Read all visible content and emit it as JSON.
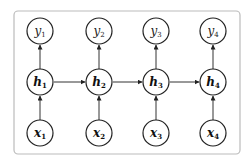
{
  "diagram": {
    "type": "unrolled-rnn",
    "frame": {
      "stroke": "#bbbbbb"
    },
    "columns": [
      {
        "output": {
          "base": "y",
          "sub": "1"
        },
        "hidden": {
          "base": "h",
          "sub": "1"
        },
        "input": {
          "base": "x",
          "sub": "1"
        }
      },
      {
        "output": {
          "base": "y",
          "sub": "2"
        },
        "hidden": {
          "base": "h",
          "sub": "2"
        },
        "input": {
          "base": "x",
          "sub": "2"
        }
      },
      {
        "output": {
          "base": "y",
          "sub": "3"
        },
        "hidden": {
          "base": "h",
          "sub": "3"
        },
        "input": {
          "base": "x",
          "sub": "3"
        }
      },
      {
        "output": {
          "base": "y",
          "sub": "4"
        },
        "hidden": {
          "base": "h",
          "sub": "4"
        },
        "input": {
          "base": "x",
          "sub": "4"
        }
      }
    ],
    "edges": [
      "x1->h1",
      "x2->h2",
      "x3->h3",
      "x4->h4",
      "h1->y1",
      "h2->y2",
      "h3->y3",
      "h4->y4",
      "h1->h2",
      "h2->h3",
      "h3->h4"
    ]
  }
}
